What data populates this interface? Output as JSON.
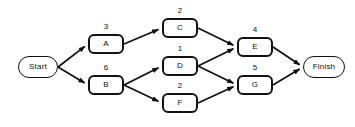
{
  "diagram": {
    "background_color": "#ffffff",
    "node_border_color": "#121212",
    "edge_color": "#101010",
    "text_color": "#101010",
    "nodes": [
      {
        "id": "start",
        "label": "Start",
        "kind": "terminal",
        "duration": null,
        "x": 18,
        "y": 56,
        "w": 40,
        "h": 22
      },
      {
        "id": "a",
        "label": "A",
        "kind": "activity",
        "duration": "3",
        "x": 88,
        "y": 34,
        "w": 36,
        "h": 20
      },
      {
        "id": "b",
        "label": "B",
        "kind": "activity",
        "duration": "6",
        "x": 88,
        "y": 75,
        "w": 36,
        "h": 20
      },
      {
        "id": "c",
        "label": "C",
        "kind": "activity",
        "duration": "2",
        "x": 162,
        "y": 18,
        "w": 36,
        "h": 20
      },
      {
        "id": "d",
        "label": "D",
        "kind": "activity",
        "duration": "1",
        "x": 162,
        "y": 56,
        "w": 36,
        "h": 20
      },
      {
        "id": "f",
        "label": "F",
        "kind": "activity",
        "duration": "2",
        "x": 162,
        "y": 93,
        "w": 36,
        "h": 20
      },
      {
        "id": "e",
        "label": "E",
        "kind": "activity",
        "duration": "4",
        "x": 237,
        "y": 37,
        "w": 36,
        "h": 20
      },
      {
        "id": "g",
        "label": "G",
        "kind": "activity",
        "duration": "5",
        "x": 237,
        "y": 75,
        "w": 36,
        "h": 20
      },
      {
        "id": "finish",
        "label": "Finish",
        "kind": "terminal",
        "duration": null,
        "x": 303,
        "y": 56,
        "w": 42,
        "h": 22
      }
    ],
    "edges": [
      {
        "from": "start",
        "to": "a"
      },
      {
        "from": "start",
        "to": "b"
      },
      {
        "from": "a",
        "to": "c"
      },
      {
        "from": "b",
        "to": "d"
      },
      {
        "from": "b",
        "to": "f"
      },
      {
        "from": "c",
        "to": "e"
      },
      {
        "from": "d",
        "to": "e"
      },
      {
        "from": "d",
        "to": "g"
      },
      {
        "from": "f",
        "to": "g"
      },
      {
        "from": "e",
        "to": "finish"
      },
      {
        "from": "g",
        "to": "finish"
      }
    ]
  }
}
